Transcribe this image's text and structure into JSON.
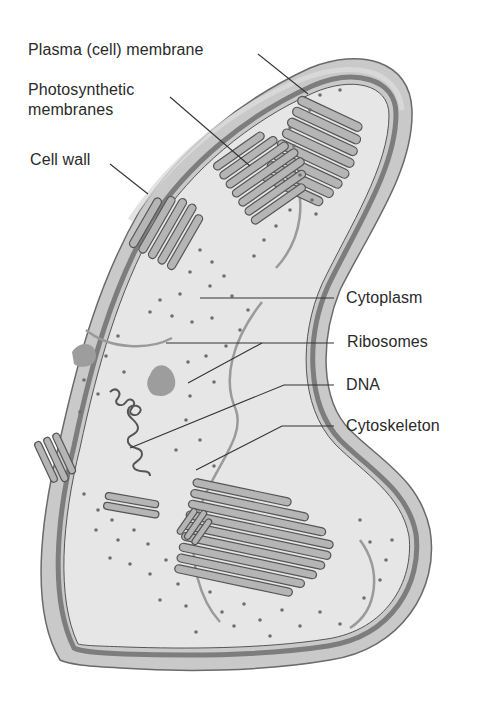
{
  "diagram": {
    "colors": {
      "background": "#ffffff",
      "cell_wall": "#c9c9c9",
      "cell_wall_edge": "#6a6a6a",
      "plasma_membrane": "#7d7d7d",
      "cytoplasm": "#e6e6e6",
      "photosynthetic_membrane_fill": "#b5b5b5",
      "photosynthetic_membrane_stroke": "#555555",
      "ribosome": "#6e6e6e",
      "cytoskeleton": "#9a9a9a",
      "inclusion": "#9d9d9d",
      "dna_stroke": "#555555",
      "leader_line": "#333333",
      "label_text": "#2a2a2a"
    },
    "labels": [
      {
        "id": "plasma-membrane",
        "text": "Plasma (cell) membrane",
        "side": "left"
      },
      {
        "id": "photosynthetic-membranes",
        "text_line1": "Photosynthetic",
        "text_line2": "membranes",
        "side": "left"
      },
      {
        "id": "cell-wall",
        "text": "Cell wall",
        "side": "left"
      },
      {
        "id": "cytoplasm",
        "text": "Cytoplasm",
        "side": "right"
      },
      {
        "id": "ribosomes",
        "text": "Ribosomes",
        "side": "right"
      },
      {
        "id": "dna",
        "text": "DNA",
        "side": "right"
      },
      {
        "id": "cytoskeleton",
        "text": "Cytoskeleton",
        "side": "right"
      }
    ]
  }
}
